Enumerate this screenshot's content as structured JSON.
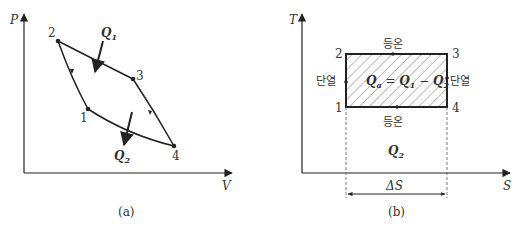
{
  "diagram_a": {
    "caption": "(a)",
    "x_axis_label": "V",
    "y_axis_label": "P",
    "points": [
      {
        "id": "1",
        "label": "1"
      },
      {
        "id": "2",
        "label": "2"
      },
      {
        "id": "3",
        "label": "3"
      },
      {
        "id": "4",
        "label": "4"
      }
    ],
    "heat_in": {
      "symbol": "Q",
      "subscript": "1"
    },
    "heat_out": {
      "symbol": "Q",
      "subscript": "2"
    }
  },
  "diagram_b": {
    "caption": "(b)",
    "x_axis_label": "S",
    "y_axis_label": "T",
    "points": [
      {
        "id": "1",
        "label": "1"
      },
      {
        "id": "2",
        "label": "2"
      },
      {
        "id": "3",
        "label": "3"
      },
      {
        "id": "4",
        "label": "4"
      }
    ],
    "top_label": "등온",
    "bottom_label": "등온",
    "left_label": "단열",
    "right_label": "단열",
    "work_eq": {
      "lhs": "Q",
      "lhs_sub": "a",
      "eq": " = ",
      "q1": "Q",
      "q1_sub": "1",
      "minus": " − ",
      "q2": "Q",
      "q2_sub": "2"
    },
    "heat_out": {
      "symbol": "Q",
      "subscript": "2"
    },
    "delta_s": "ΔS"
  },
  "colors": {
    "line": "#222222",
    "hatch": "#555555",
    "dashed": "#555555"
  }
}
